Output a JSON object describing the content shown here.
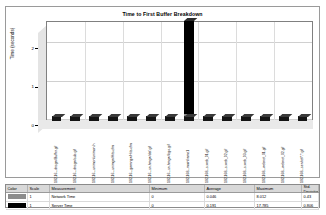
{
  "chart": {
    "title": "Time to First Buffer Breakdown",
    "y_axis_title": "Time (seconds)",
    "y_ticks": [
      "0",
      "1",
      "2"
    ]
  },
  "chart_data": {
    "type": "bar",
    "title": "Time to First Buffer Breakdown",
    "xlabel": "",
    "ylabel": "Time (seconds)",
    "ylim": [
      0,
      2.6
    ],
    "grid": true,
    "stacked": true,
    "legend_position": "bottom-table",
    "categories": [
      "192.16...dnsgw/Buffer.gif",
      "192.16...dnsgw/sub.gif",
      "192.16...unimon/unimon.h",
      "192.16...unimgw/Hits.cfm",
      "192.16...gwmngw/Hits.cfm",
      "192.16...sn.hmgw/def.gif",
      "192.16...sn.hmgw/logo.gif",
      "192.168...mainframe1",
      "192.168...s.web_01.gif",
      "192.168...s.web_02.gif",
      "192.168...s.web_03.gif",
      "192.168...webnet_01.gif",
      "192.168...webnet_02.gif",
      "192.168...servlet/*.*.gif"
    ],
    "series": [
      {
        "name": "Network Time",
        "color": "#8c8c8c",
        "values": [
          0.03,
          0.03,
          0.03,
          0.03,
          0.03,
          0.03,
          0.03,
          0.18,
          0.03,
          0.03,
          0.03,
          0.03,
          0.03,
          0.03
        ]
      },
      {
        "name": "Server Time",
        "color": "#000000",
        "values": [
          0.02,
          0.02,
          0.02,
          0.02,
          0.02,
          0.02,
          0.02,
          2.42,
          0.02,
          0.02,
          0.02,
          0.02,
          0.02,
          0.02
        ]
      }
    ]
  },
  "legend": {
    "headers": [
      "Color",
      "Scale",
      "Measurement",
      "Minimum",
      "Average",
      "Maximum",
      "Std. Deviation"
    ],
    "rows": [
      {
        "color": "#8c8c8c",
        "scale": "1",
        "measurement": "Network Time",
        "minimum": "0",
        "average": "0.046",
        "maximum": "8.012",
        "std_deviation": "0.43"
      },
      {
        "color": "#000000",
        "scale": "1",
        "measurement": "Server Time",
        "minimum": "0",
        "average": "0.191",
        "maximum": "17.785",
        "std_deviation": "0.806"
      }
    ]
  }
}
